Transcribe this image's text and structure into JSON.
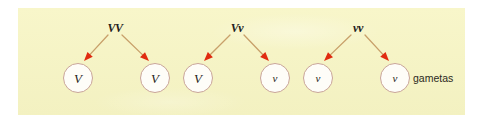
{
  "figure": {
    "type": "genetics-gamete-diagram",
    "panel_background_color": "#f7f5c4",
    "page_background_color": "#ffffff",
    "arrow_line_color": "#c8a06a",
    "arrow_head_color": "#e02b10",
    "circle_border_color": "#c9a598",
    "circle_fill_color": "#fefdf8",
    "text_color": "#23211c"
  },
  "parents": [
    {
      "id": "parent-1",
      "genotype": "VV",
      "x": 115,
      "y": 28
    },
    {
      "id": "parent-2",
      "genotype": "Vv",
      "x": 237,
      "y": 28
    },
    {
      "id": "parent-3",
      "genotype": "vv",
      "x": 358,
      "y": 28
    }
  ],
  "gametes": [
    {
      "id": "gamete-1",
      "allele": "V",
      "type": "dominant",
      "x": 78,
      "y": 78,
      "parent": "parent-1"
    },
    {
      "id": "gamete-2",
      "allele": "V",
      "type": "dominant",
      "x": 155,
      "y": 78,
      "parent": "parent-1"
    },
    {
      "id": "gamete-3",
      "allele": "V",
      "type": "dominant",
      "x": 198,
      "y": 78,
      "parent": "parent-2"
    },
    {
      "id": "gamete-4",
      "allele": "v",
      "type": "recessive",
      "x": 275,
      "y": 78,
      "parent": "parent-2"
    },
    {
      "id": "gamete-5",
      "allele": "v",
      "type": "recessive",
      "x": 318,
      "y": 78,
      "parent": "parent-3"
    },
    {
      "id": "gamete-6",
      "allele": "v",
      "type": "recessive",
      "x": 395,
      "y": 78,
      "parent": "parent-3"
    }
  ],
  "arrows": [
    {
      "id": "arrow-1",
      "from": "parent-1",
      "to": "gamete-1",
      "x1": 108,
      "y1": 35,
      "x2": 84,
      "y2": 61
    },
    {
      "id": "arrow-2",
      "from": "parent-1",
      "to": "gamete-2",
      "x1": 122,
      "y1": 35,
      "x2": 149,
      "y2": 61
    },
    {
      "id": "arrow-3",
      "from": "parent-2",
      "to": "gamete-3",
      "x1": 230,
      "y1": 35,
      "x2": 204,
      "y2": 61
    },
    {
      "id": "arrow-4",
      "from": "parent-2",
      "to": "gamete-4",
      "x1": 244,
      "y1": 35,
      "x2": 269,
      "y2": 61
    },
    {
      "id": "arrow-5",
      "from": "parent-3",
      "to": "gamete-5",
      "x1": 351,
      "y1": 35,
      "x2": 324,
      "y2": 61
    },
    {
      "id": "arrow-6",
      "from": "parent-3",
      "to": "gamete-6",
      "x1": 365,
      "y1": 35,
      "x2": 389,
      "y2": 61
    }
  ],
  "annotation": {
    "gametas_label": "gametas",
    "gametas_x": 413,
    "gametas_y": 78
  }
}
